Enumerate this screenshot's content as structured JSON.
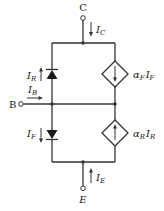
{
  "diagram": {
    "terminals": {
      "collector": "C",
      "base": "B",
      "emitter": "E"
    },
    "currents": {
      "collector": {
        "main": "I",
        "sub": "C"
      },
      "base": {
        "main": "I",
        "sub": "B"
      },
      "emitter": {
        "main": "I",
        "sub": "E"
      },
      "reverse_diode": {
        "main": "I",
        "sub": "R"
      },
      "forward_diode": {
        "main": "I",
        "sub": "F"
      }
    },
    "sources": {
      "top": {
        "alpha": "α",
        "alpha_sub": "F",
        "current": "I",
        "current_sub": "F",
        "direction": "down"
      },
      "bottom": {
        "alpha": "α",
        "alpha_sub": "R",
        "current": "I",
        "current_sub": "R",
        "direction": "up"
      }
    },
    "colors": {
      "wire": "#333333",
      "text": "#1a1a1a",
      "background": "#ffffff"
    }
  }
}
